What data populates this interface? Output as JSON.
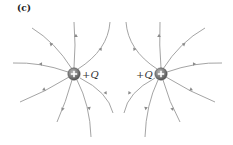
{
  "figure": {
    "panel_label": "(c)",
    "charges": [
      {
        "id": "left",
        "sign": "+",
        "label_sign": "+",
        "label_symbol": "Q",
        "cx": 74,
        "cy": 74
      },
      {
        "id": "right",
        "sign": "+",
        "label_sign": "+",
        "label_symbol": "Q",
        "cx": 161,
        "cy": 74
      }
    ],
    "colors": {
      "field_line": "#9a9a9a",
      "arrow": "#8a8a8a",
      "charge_fill": "#7d7d7d",
      "charge_plus": "#ffffff",
      "text": "#333333"
    },
    "field_lines_per_charge": 8,
    "arrow_direction": "outward"
  }
}
